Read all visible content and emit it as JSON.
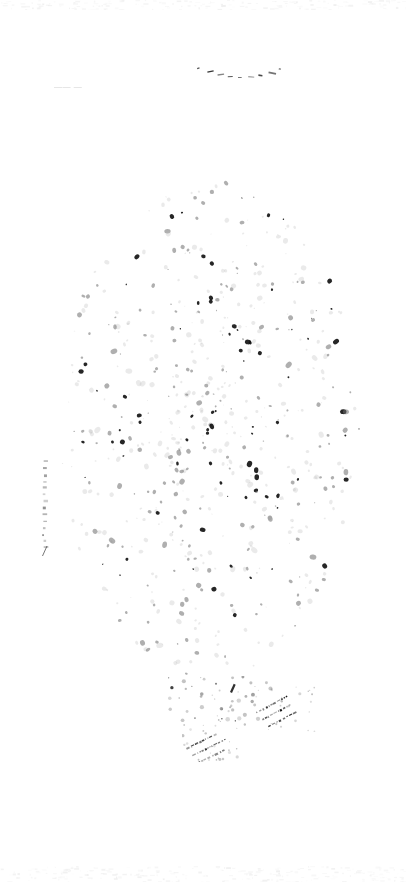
{
  "document": {
    "kind": "scanned-page",
    "condition": "severely-faded",
    "page_width": 406,
    "page_height": 882,
    "background_color": "#ffffff",
    "ink_color": "#1a1a1a",
    "faded_ink_color": "#9a9a9a"
  },
  "marks": {
    "ghost_text_upper_left": {
      "text": "——  —",
      "x": 54,
      "y": 82,
      "legible": false,
      "note": "illegible faded word fragment"
    },
    "arc_top_center": {
      "label": "faded curved line of marks",
      "x": 194,
      "y": 62,
      "width": 90,
      "height": 22,
      "dash_count": 9
    },
    "margin_mark_left": {
      "label": "faint vertical margin mark",
      "x": 40,
      "y": 458,
      "width": 10,
      "height": 100,
      "dash_count": 14
    },
    "strokes_right": {
      "label": "diagonal hand strokes",
      "x": 252,
      "y": 686,
      "width": 66,
      "height": 46,
      "stroke_count": 3,
      "angle_deg": -28
    },
    "strokes_left": {
      "label": "diagonal hand strokes",
      "x": 182,
      "y": 722,
      "width": 64,
      "height": 40,
      "stroke_count": 3,
      "angle_deg": -26
    }
  },
  "speckle_field": {
    "label": "degradation speckle noise",
    "center_x": 210,
    "center_y": 430,
    "radius_x": 150,
    "radius_y": 250,
    "count": 620,
    "min_size": 0.5,
    "max_size": 2.6,
    "seed": 20240517
  },
  "edge_noise": {
    "top": {
      "y": 0,
      "height": 10,
      "count": 180,
      "seed": 7731
    },
    "bottom": {
      "y": 866,
      "height": 16,
      "count": 240,
      "seed": 4417
    }
  }
}
